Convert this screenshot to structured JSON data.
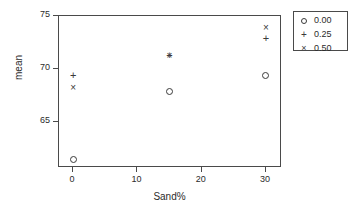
{
  "chart_data": {
    "type": "scatter",
    "title": "",
    "xlabel": "Sand%",
    "ylabel": "mean",
    "xlim": [
      -2.2,
      32.5
    ],
    "ylim": [
      60.7,
      75.0
    ],
    "xticks": [
      0,
      10,
      20,
      30
    ],
    "xticklabels": [
      "0",
      "10",
      "20",
      "30"
    ],
    "yticks": [
      65,
      70,
      75
    ],
    "yticklabels": [
      "65",
      "70",
      "75"
    ],
    "grid": false,
    "legend_position": "top-right",
    "legend_title": "",
    "series": [
      {
        "name": "0.00",
        "marker": "circle",
        "x": [
          0,
          15,
          30
        ],
        "values": [
          61.5,
          67.9,
          69.4
        ]
      },
      {
        "name": "0.25",
        "marker": "plus",
        "x": [
          0,
          15,
          30
        ],
        "values": [
          69.4,
          71.3,
          72.9
        ]
      },
      {
        "name": "0.50",
        "marker": "cross",
        "x": [
          0,
          15,
          30
        ],
        "values": [
          68.3,
          71.3,
          73.9
        ]
      }
    ]
  },
  "axis": {
    "x_title": "Sand%",
    "y_title": "mean",
    "x_ticks": [
      {
        "label": "0"
      },
      {
        "label": "10"
      },
      {
        "label": "20"
      },
      {
        "label": "30"
      }
    ],
    "y_ticks": [
      {
        "label": "75"
      },
      {
        "label": "70"
      },
      {
        "label": "65"
      }
    ]
  },
  "legend": {
    "entries": [
      {
        "label": "0.00",
        "marker": "circle"
      },
      {
        "label": "0.25",
        "marker": "plus"
      },
      {
        "label": "0.50",
        "marker": "cross"
      }
    ]
  },
  "colors": {
    "marker": "#3a3a3a",
    "frame": "#4a4a4a",
    "text": "#2b2b2b",
    "background": "#ffffff"
  }
}
